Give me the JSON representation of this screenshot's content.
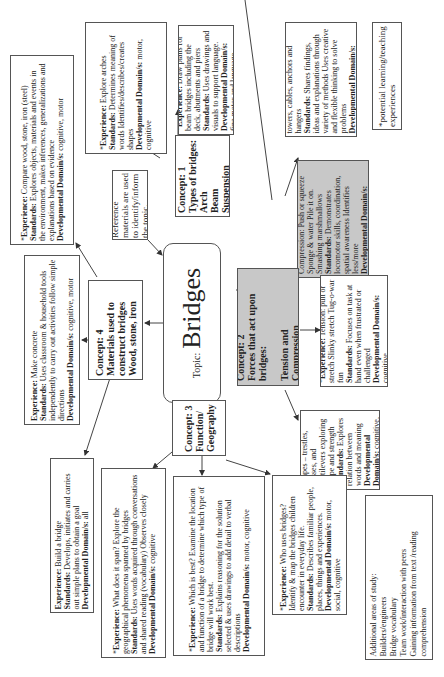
{
  "topic": {
    "label": "Topic:",
    "title": "Bridges"
  },
  "reference": {
    "text": "Reference materials are used to identify/inform the topic."
  },
  "legend": {
    "text": "*potential learning/teaching experiences"
  },
  "concepts": [
    {
      "id": "c1",
      "lines": [
        "Concept: 1",
        "Types of bridges:",
        "Arch",
        "Beam",
        "Suspension"
      ]
    },
    {
      "id": "c2",
      "lines": [
        "Concept: 2",
        "Forces that act upon bridges:",
        "",
        "Tension and Compression"
      ]
    },
    {
      "id": "c3",
      "lines": [
        "Concept: 3",
        "Function/",
        "Geography"
      ]
    },
    {
      "id": "c4",
      "lines": [
        "Concept: 4",
        "Materials used to construct bridges",
        "Wood, stone, iron"
      ]
    }
  ],
  "experiences": {
    "compare_materials": {
      "exp": "Compare wood, stone, iron (steel)",
      "std": "Explores objects, materials and events in the environment, makes inferences, generalizations and explanations based on evidence",
      "dom": "cognitive, motor",
      "star": true
    },
    "arches": {
      "exp": "Explore arches",
      "std": "Determines meaning of words Identifies/describes/creates shapes",
      "dom": "motor, cognitive",
      "star": true
    },
    "beam": {
      "exp": "Draw plans for beam bridges including the deck, abutments and piers",
      "std": "Uses drawings and visuals to support language.",
      "dom": "fine motor and language",
      "star": true
    },
    "suspension": {
      "exp": "Suspension: towers, cables, anchors and hangers",
      "std": "Shares findings, ideas and explanations through variety of methods Uses creative and flexible thinking to solve problems",
      "dom": "cognitive, motor, social",
      "star": true
    },
    "compression": {
      "exp": "Introduce Compression: Push or squeeze Sponge & water Pile it on. Smashing marshmallows",
      "std": "Demonstrates locomotor skills, coordination, spatial awareness Identifies less/more",
      "dom": "motor, cognitive",
      "star": true
    },
    "tension": {
      "exp": "Tension: pull or stretch Slinky stretch Tug-o-war fun",
      "std": "Focuses on task at hand even when frustrated or challenged",
      "dom": "cognitive",
      "star": true
    },
    "shapes": {
      "exp": "Strong Shapes – trestles, trusses, and cantilevers exploring shape and strength",
      "std": "Explores relation between words and meaning",
      "dom": "cognitive, motor",
      "star": true
    },
    "concrete": {
      "exp": "Make concrete",
      "std": "Uses classroom & household tools independently to carry out activities follow simple directions",
      "dom": "cognitive, motor",
      "star": false
    },
    "build": {
      "exp": "Build a bridge",
      "std": "Develops, initiates and carries out simple plans to obtain a goal",
      "dom": "all",
      "star": false
    },
    "span": {
      "exp": "What does it span? Explore the geographical phenomena spanned by bridges",
      "std": "Uses words acquired through conversations and shared reading (vocabulary) Observes closely",
      "dom": "cognitive",
      "star": true
    },
    "best": {
      "exp": "Which is best? Examine the location and function of a bridge to determine which type of bridge will work best.",
      "std": "Explains reasoning for the solution selected & uses drawings to add detail to verbal descriptions",
      "dom": "motor, cognitive",
      "star": true
    },
    "who": {
      "exp": "Who uses bridges? Identify & map the bridges children encounter in everyday life.",
      "std": "Describes familiar people, places, things and experiences.",
      "dom": "motor, social, cognitive",
      "star": true
    }
  },
  "labels": {
    "experience": "Experience:",
    "standards": "Standards:",
    "domains": "Developmental Domain/s:"
  },
  "additional": {
    "lines": [
      "Additional areas of study:",
      "Builders/engineers",
      "Bridge vocabulary",
      "Team work/interaction with peers",
      "Gaining information from text /reading comprehension"
    ]
  }
}
